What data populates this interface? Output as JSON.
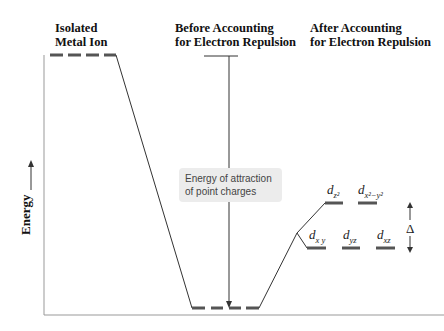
{
  "columns": {
    "isolated": "Isolated\nMetal Ion",
    "before": "Before Accounting\nfor Electron Repulsion",
    "after": "After Accounting\nfor Electron Repulsion"
  },
  "axis": {
    "ylabel": "Energy"
  },
  "callout": "Energy of attraction of point charges",
  "orbitals": {
    "upper": [
      {
        "d": "d",
        "sub": "z²"
      },
      {
        "d": "d",
        "sub": "x²−y²"
      }
    ],
    "lower": [
      {
        "d": "d",
        "sub": "xy"
      },
      {
        "d": "d",
        "sub": "yz"
      },
      {
        "d": "d",
        "sub": "xz"
      }
    ]
  },
  "labels": {
    "dz2": "z²",
    "dx2y2": "x²−y²",
    "dxy": "x y",
    "dyz": "yz",
    "dxz": "xz",
    "d": "d",
    "splitting": "Δ"
  },
  "colors": {
    "level": "#555555",
    "line": "#333333",
    "axis": "#999999"
  }
}
